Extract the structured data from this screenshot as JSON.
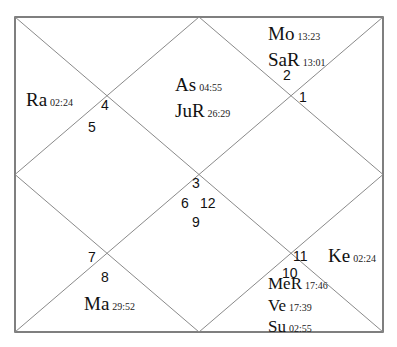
{
  "chart": {
    "type": "north-indian-birth-chart",
    "box": {
      "left": 15,
      "top": 17,
      "right": 383,
      "bottom": 332
    },
    "line_color": "#8a8a8a",
    "border_color": "#555555"
  },
  "houses": [
    {
      "number": "1",
      "x": 299,
      "y": 90
    },
    {
      "number": "2",
      "x": 283,
      "y": 68
    },
    {
      "number": "3",
      "x": 192,
      "y": 176
    },
    {
      "number": "4",
      "x": 101,
      "y": 98
    },
    {
      "number": "5",
      "x": 88,
      "y": 120
    },
    {
      "number": "6",
      "x": 181,
      "y": 196
    },
    {
      "number": "7",
      "x": 88,
      "y": 250
    },
    {
      "number": "8",
      "x": 101,
      "y": 270
    },
    {
      "number": "9",
      "x": 192,
      "y": 215
    },
    {
      "number": "10",
      "x": 282,
      "y": 266
    },
    {
      "number": "11",
      "x": 293,
      "y": 249
    },
    {
      "number": "12",
      "x": 200,
      "y": 196
    }
  ],
  "planets": [
    {
      "name": "Mo",
      "degree": "13:23",
      "x": 268,
      "y": 24
    },
    {
      "name": "SaR",
      "degree": "13:01",
      "x": 268,
      "y": 50
    },
    {
      "name": "Ra",
      "degree": "02:24",
      "x": 26,
      "y": 90
    },
    {
      "name": "As",
      "degree": "04:55",
      "x": 175,
      "y": 75
    },
    {
      "name": "JuR",
      "degree": "26:29",
      "x": 175,
      "y": 101
    },
    {
      "name": "Ma",
      "degree": "29:52",
      "x": 84,
      "y": 294
    },
    {
      "name": "Ke",
      "degree": "02:24",
      "x": 328,
      "y": 246
    },
    {
      "name": "MeR",
      "degree": "17:46",
      "x": 268,
      "y": 275
    },
    {
      "name": "Ve",
      "degree": "17:39",
      "x": 268,
      "y": 297
    },
    {
      "name": "Su",
      "degree": "02:55",
      "x": 268,
      "y": 318
    }
  ]
}
